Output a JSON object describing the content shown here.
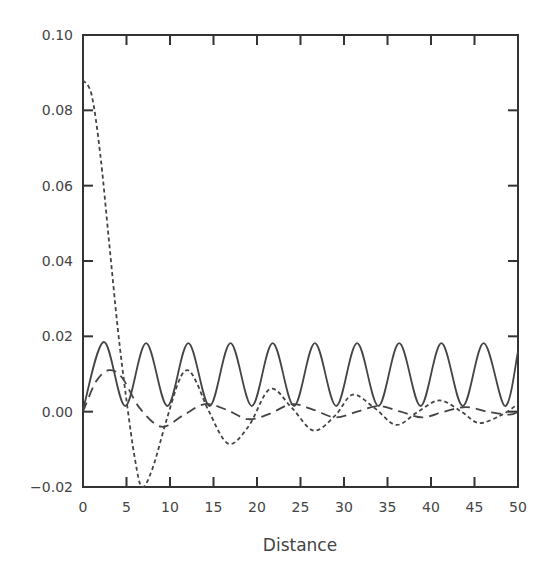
{
  "chart_data": {
    "type": "line",
    "title": "",
    "xlabel": "Distance",
    "ylabel": "",
    "xlim": [
      0,
      50
    ],
    "ylim": [
      -0.02,
      0.1
    ],
    "grid": false,
    "legend": null,
    "x_ticks": [
      "0",
      "5",
      "10",
      "15",
      "20",
      "25",
      "30",
      "35",
      "40",
      "45",
      "50"
    ],
    "y_ticks": [
      "-0.02",
      "0.00",
      "0.02",
      "0.04",
      "0.06",
      "0.08",
      "0.10"
    ],
    "series": [
      {
        "name": "solid",
        "style": "solid",
        "x": [
          0,
          2.4,
          4.85,
          7.25,
          9.7,
          12.1,
          14.55,
          16.95,
          19.4,
          21.8,
          24.25,
          26.65,
          29.1,
          31.5,
          33.95,
          36.35,
          38.8,
          41.2,
          43.65,
          46.05,
          48.5,
          50
        ],
        "y": [
          0.0005,
          0.0185,
          0.0015,
          0.0182,
          0.0015,
          0.0182,
          0.0015,
          0.0182,
          0.0015,
          0.0182,
          0.0015,
          0.0182,
          0.0015,
          0.0182,
          0.0015,
          0.0182,
          0.0015,
          0.0182,
          0.0015,
          0.0182,
          0.0015,
          0.016
        ]
      },
      {
        "name": "short-dashed",
        "style": "short-dash",
        "x": [
          0,
          1,
          2,
          3,
          4,
          5,
          6,
          6.8,
          8,
          9.5,
          11,
          12,
          13,
          14.5,
          16.7,
          19,
          21.5,
          24,
          26.5,
          29,
          31,
          33.5,
          36,
          38.5,
          41,
          43.5,
          45.5,
          48,
          50
        ],
        "y": [
          0.088,
          0.084,
          0.068,
          0.045,
          0.022,
          0.003,
          -0.013,
          -0.02,
          -0.015,
          -0.003,
          0.008,
          0.011,
          0.008,
          0.0,
          -0.0085,
          -0.004,
          0.006,
          0.001,
          -0.005,
          -0.001,
          0.0045,
          0.001,
          -0.0035,
          0.0,
          0.003,
          0.0,
          -0.003,
          -0.001,
          0.002
        ]
      },
      {
        "name": "long-dashed",
        "style": "long-dash",
        "x": [
          0,
          1.5,
          3,
          4.5,
          6.5,
          9,
          11.5,
          14,
          16.5,
          19,
          21.5,
          24,
          26.5,
          29,
          31.5,
          34,
          36.5,
          39,
          41.5,
          44,
          46.5,
          49,
          50
        ],
        "y": [
          0.0,
          0.008,
          0.011,
          0.009,
          0.001,
          -0.004,
          -0.001,
          0.002,
          0.0005,
          -0.002,
          -0.0005,
          0.002,
          0.0005,
          -0.0015,
          0.0,
          0.0015,
          0.0,
          -0.0015,
          0.0,
          0.0012,
          0.0,
          -0.0008,
          0.0
        ]
      }
    ]
  }
}
